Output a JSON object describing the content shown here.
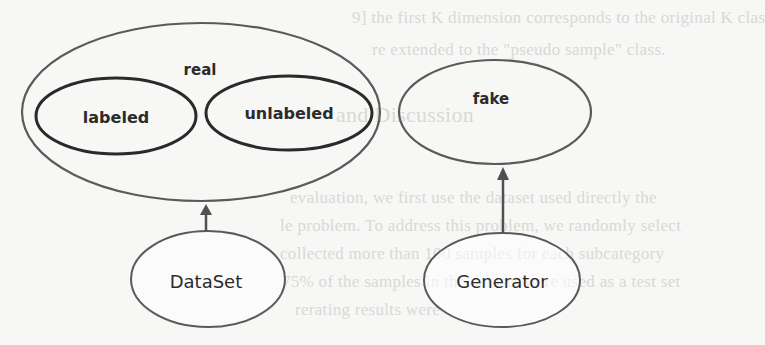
{
  "diagram": {
    "nodes": {
      "real": {
        "label": "real"
      },
      "labeled": {
        "label": "labeled"
      },
      "unlabeled": {
        "label": "unlabeled"
      },
      "fake": {
        "label": "fake"
      },
      "dataset": {
        "label": "DataSet"
      },
      "generator": {
        "label": "Generator"
      }
    },
    "edges": [
      {
        "from": "DataSet",
        "to": "real"
      },
      {
        "from": "Generator",
        "to": "fake"
      }
    ],
    "colors": {
      "outline": "#5a5a5a",
      "inner_outline": "#2a2a2a",
      "arrow": "#505050",
      "text": "#2b2b2b",
      "background": "#f7f7f5"
    }
  },
  "background_bleed": {
    "lines": [
      "9] the first K dimension corresponds to the original K clas",
      "re extended to the \"pseudo sample\" class.",
      "and Discussion",
      "evaluation, we first use the dataset used directly the",
      "le problem. To address this problem, we randomly select",
      "collected more than 100 samples for each subcategory",
      "75% of the samples in the dataset were used as a test set",
      "rerating results were"
    ]
  }
}
